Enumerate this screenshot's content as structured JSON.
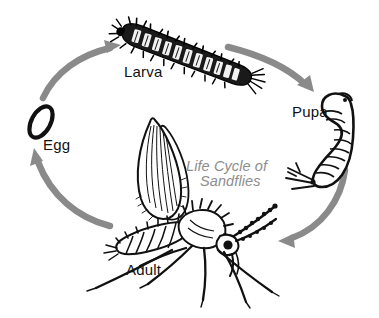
{
  "diagram": {
    "title": "Life Cycle of Sandflies",
    "title_line_1": "Life Cycle of",
    "title_line_2": "Sandflies",
    "title_color": "#8d8d8d",
    "background_color": "#ffffff",
    "arrow_color": "#8a8a8a",
    "ink_color": "#111111",
    "type": "cyclical life-cycle diagram",
    "stages": [
      {
        "id": "egg",
        "label": "Egg",
        "icon": "egg-ellipse-icon",
        "position": "left"
      },
      {
        "id": "larva",
        "label": "Larva",
        "icon": "larva-caterpillar-icon",
        "position": "top"
      },
      {
        "id": "pupa",
        "label": "Pupa",
        "icon": "pupa-comma-icon",
        "position": "right"
      },
      {
        "id": "adult",
        "label": "Adult",
        "icon": "adult-sandfly-icon",
        "position": "bottom"
      }
    ],
    "arrows": [
      {
        "id": "egg-to-larva",
        "from": "Egg",
        "to": "Larva",
        "direction": "up-right"
      },
      {
        "id": "larva-to-pupa",
        "from": "Larva",
        "to": "Pupa",
        "direction": "down-right"
      },
      {
        "id": "pupa-to-adult",
        "from": "Pupa",
        "to": "Adult",
        "direction": "down-left"
      },
      {
        "id": "adult-to-egg",
        "from": "Adult",
        "to": "Egg",
        "direction": "up-left"
      }
    ]
  }
}
